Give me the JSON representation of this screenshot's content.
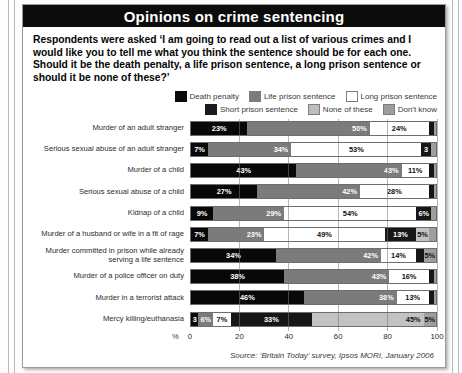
{
  "title": "Opinions on crime sentencing",
  "intro": "Respondents were asked ‘I am going to read out a list of various crimes and I would like you to tell me what you think the sentence should be for each one. Should it be the death penalty, a life prison sentence, a long prison sentence or should it be none of these?’",
  "legend": {
    "row1": [
      {
        "key": "death",
        "label": "Death penalty",
        "color": "#080808"
      },
      {
        "key": "life",
        "label": "Life prison sentence",
        "color": "#7b7b7b"
      },
      {
        "key": "long",
        "label": "Long prison sentence",
        "color": "#ffffff"
      }
    ],
    "row2": [
      {
        "key": "short",
        "label": "Short prison sentence",
        "color": "#161616"
      },
      {
        "key": "none",
        "label": "None of these",
        "color": "#c2c2c2"
      },
      {
        "key": "dk",
        "label": "Don't know",
        "color": "#9e9e9e"
      }
    ]
  },
  "axis": {
    "unit": "%",
    "ticks": [
      "0",
      "20",
      "40",
      "60",
      "80",
      "100"
    ],
    "min": 0,
    "max": 100
  },
  "source": "Source: ‘Britain Today’ survey, Ipsos MORI, January 2006",
  "chart_data": {
    "type": "bar",
    "orientation": "horizontal",
    "stacked": true,
    "title": "Opinions on crime sentencing",
    "xlabel": "%",
    "ylabel": "",
    "xlim": [
      0,
      100
    ],
    "grid": true,
    "legend_position": "top-right",
    "series": [
      {
        "name": "Death penalty",
        "color": "#080808",
        "values": [
          23,
          7,
          43,
          27,
          9,
          7,
          34,
          38,
          46,
          3
        ]
      },
      {
        "name": "Life prison sentence",
        "color": "#7b7b7b",
        "values": [
          50,
          34,
          43,
          42,
          29,
          23,
          42,
          43,
          38,
          6
        ]
      },
      {
        "name": "Long prison sentence",
        "color": "#ffffff",
        "values": [
          24,
          53,
          11,
          28,
          54,
          49,
          14,
          16,
          13,
          7
        ]
      },
      {
        "name": "Short prison sentence",
        "color": "#161616",
        "values": [
          1,
          3,
          1,
          1,
          6,
          13,
          2,
          1,
          1,
          33
        ]
      },
      {
        "name": "None of these",
        "color": "#c2c2c2",
        "values": [
          1,
          2,
          1,
          1,
          1,
          5,
          3,
          1,
          1,
          45
        ]
      },
      {
        "name": "Don't know",
        "color": "#9e9e9e",
        "values": [
          1,
          1,
          1,
          1,
          1,
          3,
          5,
          1,
          1,
          5
        ]
      }
    ],
    "categories": [
      "Murder of an adult stranger",
      "Serious sexual abuse of an adult stranger",
      "Murder of a child",
      "Serious sexual abuse of a child",
      "Kidnap of a child",
      "Murder of a husband or wife in a fit of rage",
      "Murder committed in prison while already serving a life sentence",
      "Murder of a police officer on duty",
      "Murder in a terrorist attack",
      "Mercy killing/euthanasia"
    ],
    "rows": [
      {
        "label": "Murder of an adult stranger",
        "segments": [
          {
            "key": "death",
            "value": 23,
            "text": "23%"
          },
          {
            "key": "life",
            "value": 50,
            "text": "50%"
          },
          {
            "key": "long",
            "value": 24,
            "text": "24%"
          },
          {
            "key": "short",
            "value": 2,
            "text": ""
          },
          {
            "key": "dk",
            "value": 1,
            "text": ""
          }
        ]
      },
      {
        "label": "Serious sexual abuse of an adult stranger",
        "segments": [
          {
            "key": "death",
            "value": 7,
            "text": "7%"
          },
          {
            "key": "life",
            "value": 34,
            "text": "34%"
          },
          {
            "key": "long",
            "value": 53,
            "text": "53%"
          },
          {
            "key": "short",
            "value": 4,
            "text": "3"
          },
          {
            "key": "dk",
            "value": 2,
            "text": ""
          }
        ]
      },
      {
        "label": "Murder of a child",
        "segments": [
          {
            "key": "death",
            "value": 43,
            "text": "43%"
          },
          {
            "key": "life",
            "value": 43,
            "text": "43%"
          },
          {
            "key": "long",
            "value": 11,
            "text": "11%"
          },
          {
            "key": "short",
            "value": 2,
            "text": ""
          },
          {
            "key": "dk",
            "value": 1,
            "text": ""
          }
        ]
      },
      {
        "label": "Serious sexual abuse of a child",
        "segments": [
          {
            "key": "death",
            "value": 27,
            "text": "27%"
          },
          {
            "key": "life",
            "value": 42,
            "text": "42%"
          },
          {
            "key": "long",
            "value": 28,
            "text": "28%"
          },
          {
            "key": "short",
            "value": 2,
            "text": ""
          },
          {
            "key": "dk",
            "value": 1,
            "text": ""
          }
        ]
      },
      {
        "label": "Kidnap of a child",
        "segments": [
          {
            "key": "death",
            "value": 9,
            "text": "9%"
          },
          {
            "key": "life",
            "value": 29,
            "text": "29%"
          },
          {
            "key": "long",
            "value": 54,
            "text": "54%"
          },
          {
            "key": "short",
            "value": 6,
            "text": "6%"
          },
          {
            "key": "dk",
            "value": 2,
            "text": ""
          }
        ]
      },
      {
        "label": "Murder of a husband or wife in a fit of rage",
        "segments": [
          {
            "key": "death",
            "value": 7,
            "text": "7%"
          },
          {
            "key": "life",
            "value": 23,
            "text": "23%"
          },
          {
            "key": "long",
            "value": 49,
            "text": "49%"
          },
          {
            "key": "short",
            "value": 13,
            "text": "13%"
          },
          {
            "key": "none",
            "value": 5,
            "text": "5%"
          },
          {
            "key": "dk",
            "value": 3,
            "text": ""
          }
        ]
      },
      {
        "label": "Murder committed in prison while already serving a life sentence",
        "segments": [
          {
            "key": "death",
            "value": 34,
            "text": "34%"
          },
          {
            "key": "life",
            "value": 42,
            "text": "42%"
          },
          {
            "key": "long",
            "value": 14,
            "text": "14%"
          },
          {
            "key": "short",
            "value": 3,
            "text": ""
          },
          {
            "key": "dk",
            "value": 5,
            "text": "5%"
          }
        ]
      },
      {
        "label": "Murder of a police officer on duty",
        "segments": [
          {
            "key": "death",
            "value": 38,
            "text": "38%"
          },
          {
            "key": "life",
            "value": 43,
            "text": "43%"
          },
          {
            "key": "long",
            "value": 16,
            "text": "16%"
          },
          {
            "key": "short",
            "value": 2,
            "text": ""
          },
          {
            "key": "dk",
            "value": 1,
            "text": ""
          }
        ]
      },
      {
        "label": "Murder in a terrorist attack",
        "segments": [
          {
            "key": "death",
            "value": 46,
            "text": "46%"
          },
          {
            "key": "life",
            "value": 38,
            "text": "38%"
          },
          {
            "key": "long",
            "value": 13,
            "text": "13%"
          },
          {
            "key": "short",
            "value": 2,
            "text": ""
          },
          {
            "key": "dk",
            "value": 1,
            "text": ""
          }
        ]
      },
      {
        "label": "Mercy killing/euthanasia",
        "segments": [
          {
            "key": "death",
            "value": 3,
            "text": "3"
          },
          {
            "key": "life",
            "value": 6,
            "text": "6%"
          },
          {
            "key": "long",
            "value": 7,
            "text": "7%"
          },
          {
            "key": "short",
            "value": 33,
            "text": "33%"
          },
          {
            "key": "none",
            "value": 45,
            "text": "45%"
          },
          {
            "key": "dk",
            "value": 5,
            "text": "5%"
          }
        ]
      }
    ]
  }
}
